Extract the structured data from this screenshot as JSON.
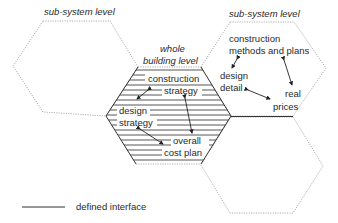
{
  "diagram": {
    "type": "hexagon-levels",
    "nodes": [
      {
        "id": "left_hex",
        "level_label": "sub-system level",
        "items": []
      },
      {
        "id": "center_hex",
        "level_label": "whole building level",
        "level_label_lines": [
          "whole",
          "building level"
        ],
        "items": [
          "construction strategy",
          "design strategy",
          "overall cost plan"
        ]
      },
      {
        "id": "top_right_hex",
        "level_label": "sub-system level",
        "items": [
          "construction methods and plans",
          "design detail",
          "real prices"
        ]
      },
      {
        "id": "bottom_right_hex",
        "level_label": "",
        "items": []
      }
    ],
    "labels": {
      "left_level": "sub-system level",
      "right_level": "sub-system level",
      "center_level_1": "whole",
      "center_level_2": "building level",
      "construction_strategy_1": "construction",
      "construction_strategy_2": "strategy",
      "design_strategy_1": "design",
      "design_strategy_2": "strategy",
      "overall_cost_plan_1": "overall",
      "overall_cost_plan_2": "cost plan",
      "construction_methods_1": "construction",
      "construction_methods_2": "methods and plans",
      "design_detail_1": "design",
      "design_detail_2": "detail",
      "real_prices_1": "real",
      "real_prices_2": "prices"
    },
    "edges": [
      {
        "from": "construction strategy",
        "to": "design strategy",
        "bidirectional": true
      },
      {
        "from": "construction strategy",
        "to": "overall cost plan",
        "bidirectional": true
      },
      {
        "from": "design strategy",
        "to": "overall cost plan",
        "bidirectional": true
      },
      {
        "from": "construction methods and plans",
        "to": "design detail",
        "bidirectional": true
      },
      {
        "from": "construction methods and plans",
        "to": "real prices",
        "bidirectional": true
      },
      {
        "from": "design detail",
        "to": "real prices",
        "bidirectional": true
      }
    ],
    "legend": {
      "solid_line_label": "defined interface"
    },
    "colors": {
      "solid_line": "#333333",
      "dashed_outline": "#9a9a9a",
      "text": "#2a2a2a"
    }
  }
}
